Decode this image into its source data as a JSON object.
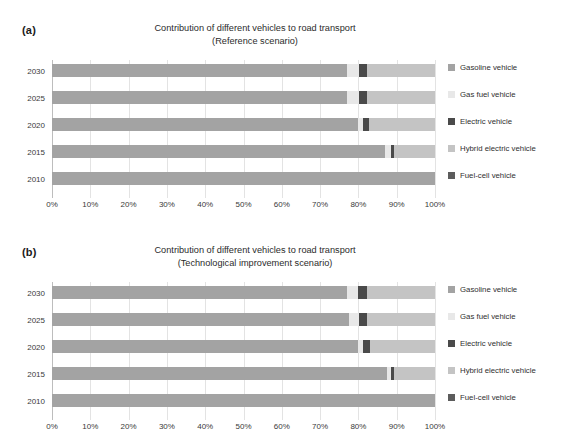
{
  "figure": {
    "background": "#ffffff"
  },
  "series_colors": {
    "gasoline": "#a3a3a3",
    "gas_fuel": "#e8e8e8",
    "electric": "#4a4a4a",
    "hybrid": "#c4c4c4",
    "fuel_cell": "#5c5c5c"
  },
  "legend": {
    "items": [
      {
        "label": "Gasoline vehicle",
        "color": "#a3a3a3"
      },
      {
        "label": "Gas fuel vehicle",
        "color": "#e8e8e8"
      },
      {
        "label": "Electric vehicle",
        "color": "#4a4a4a"
      },
      {
        "label": "Hybrid electric vehicle",
        "color": "#c4c4c4"
      },
      {
        "label": "Fuel-cell vehicle",
        "color": "#5c5c5c"
      }
    ]
  },
  "panels": [
    {
      "panel_label": "(a)",
      "title_line1": "Contribution of different vehicles to road transport",
      "title_line2": "(Reference scenario)"
    },
    {
      "panel_label": "(b)",
      "title_line1": "Contribution of different vehicles to road transport",
      "title_line2": "(Technological improvement scenario)"
    }
  ],
  "xticks": [
    "0%",
    "10%",
    "20%",
    "30%",
    "40%",
    "50%",
    "60%",
    "70%",
    "80%",
    "90%",
    "100%"
  ],
  "chart_data": [
    {
      "type": "bar",
      "orientation": "horizontal",
      "stacked": true,
      "normalized": true,
      "title": "Contribution of different vehicles to road transport (Reference scenario)",
      "panel": "(a)",
      "xlabel": "",
      "ylabel": "",
      "xlim": [
        0,
        100
      ],
      "xtick_values": [
        0,
        10,
        20,
        30,
        40,
        50,
        60,
        70,
        80,
        90,
        100
      ],
      "xtick_labels": [
        "0%",
        "10%",
        "20%",
        "30%",
        "40%",
        "50%",
        "60%",
        "70%",
        "80%",
        "90%",
        "100%"
      ],
      "grid": true,
      "legend_position": "right",
      "categories": [
        "2030",
        "2025",
        "2020",
        "2015",
        "2010"
      ],
      "series": [
        {
          "name": "Gasoline vehicle",
          "values": [
            77.0,
            77.0,
            80.0,
            87.0,
            100.0
          ]
        },
        {
          "name": "Gas fuel vehicle",
          "values": [
            3.2,
            3.2,
            1.3,
            1.6,
            0.0
          ]
        },
        {
          "name": "Electric vehicle",
          "values": [
            2.0,
            2.0,
            1.5,
            0.8,
            0.0
          ]
        },
        {
          "name": "Hybrid electric vehicle",
          "values": [
            17.8,
            17.8,
            17.2,
            10.6,
            0.0
          ]
        },
        {
          "name": "Fuel-cell vehicle",
          "values": [
            0.0,
            0.0,
            0.0,
            0.0,
            0.0
          ]
        }
      ]
    },
    {
      "type": "bar",
      "orientation": "horizontal",
      "stacked": true,
      "normalized": true,
      "title": "Contribution of different vehicles to road transport (Technological improvement scenario)",
      "panel": "(b)",
      "xlabel": "",
      "ylabel": "",
      "xlim": [
        0,
        100
      ],
      "xtick_values": [
        0,
        10,
        20,
        30,
        40,
        50,
        60,
        70,
        80,
        90,
        100
      ],
      "xtick_labels": [
        "0%",
        "10%",
        "20%",
        "30%",
        "40%",
        "50%",
        "60%",
        "70%",
        "80%",
        "90%",
        "100%"
      ],
      "grid": true,
      "legend_position": "right",
      "categories": [
        "2030",
        "2025",
        "2020",
        "2015",
        "2010"
      ],
      "series": [
        {
          "name": "Gasoline vehicle",
          "values": [
            77.0,
            77.5,
            80.0,
            87.5,
            100.0
          ]
        },
        {
          "name": "Gas fuel vehicle",
          "values": [
            3.0,
            2.6,
            1.2,
            1.0,
            0.0
          ]
        },
        {
          "name": "Electric vehicle",
          "values": [
            2.2,
            2.2,
            1.8,
            0.9,
            0.0
          ]
        },
        {
          "name": "Hybrid electric vehicle",
          "values": [
            17.8,
            17.7,
            17.0,
            10.6,
            0.0
          ]
        },
        {
          "name": "Fuel-cell vehicle",
          "values": [
            0.0,
            0.0,
            0.0,
            0.0,
            0.0
          ]
        }
      ]
    }
  ]
}
